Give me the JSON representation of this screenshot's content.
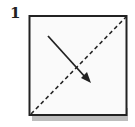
{
  "diagram": {
    "step_number": "1",
    "shape": "square",
    "fold_line": {
      "style": "dashed",
      "from": "bottom-left",
      "to": "top-right"
    },
    "arrow": {
      "direction": "down-right",
      "meaning": "fold direction"
    },
    "colors": {
      "paper": "#ffffff",
      "outline": "#222222",
      "shadow": "#b8b8b8"
    }
  }
}
